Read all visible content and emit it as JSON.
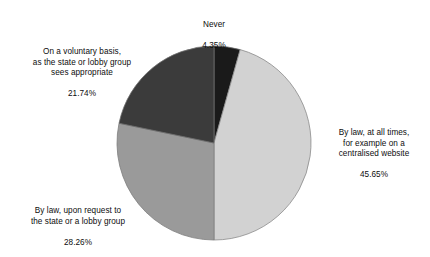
{
  "chart_data": {
    "type": "pie",
    "title": "",
    "subtitle": "",
    "xlabel": "",
    "ylabel": "",
    "legend_position": "none",
    "grid": false,
    "units": "percent",
    "label_format": "text above percentage",
    "start_angle_deg": 0,
    "direction": "clockwise",
    "categories": [
      "Never",
      "By law, at all times, for example on a centralised website",
      "By law, upon request to the state or a lobby group",
      "On a voluntary basis, as the state or lobby group sees appropriate"
    ],
    "values": [
      4.35,
      45.65,
      28.26,
      21.74
    ],
    "slices": [
      {
        "name": "never",
        "label_lines": "Never",
        "value": 4.35,
        "value_label": "4.35%",
        "color": "#1a1a1a",
        "start_deg": 0,
        "end_deg": 15.66
      },
      {
        "name": "by-law-all-times",
        "label_lines": "By law, at all times,\nfor example on a\ncentralised website",
        "value": 45.65,
        "value_label": "45.65%",
        "color": "#d2d2d2",
        "start_deg": 15.66,
        "end_deg": 180.0
      },
      {
        "name": "by-law-upon-request",
        "label_lines": "By law, upon request to\nthe state or a lobby group",
        "value": 28.26,
        "value_label": "28.26%",
        "color": "#9a9a9a",
        "start_deg": 180.0,
        "end_deg": 281.74
      },
      {
        "name": "voluntary-basis",
        "label_lines": "On a voluntary basis,\nas the state or lobby group\nsees appropriate",
        "value": 21.74,
        "value_label": "21.74%",
        "color": "#3b3b3b",
        "start_deg": 281.74,
        "end_deg": 360.0
      }
    ],
    "outline_color": "#7d7d7d",
    "background_color": "#ffffff"
  }
}
